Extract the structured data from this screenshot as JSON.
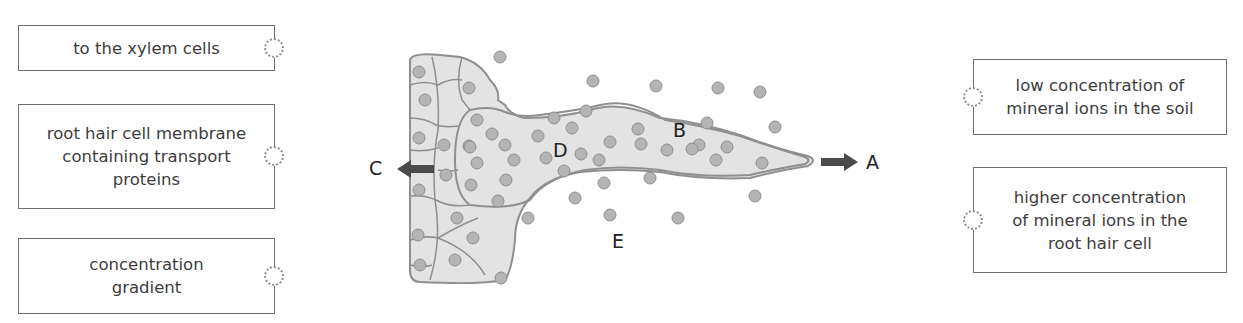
{
  "left_labels": [
    {
      "text": "to the xylem cells"
    },
    {
      "text": "root hair cell membrane containing transport proteins",
      "lines": [
        "root hair cell membrane",
        "containing transport",
        "proteins"
      ]
    },
    {
      "text": "concentration gradient",
      "lines": [
        "concentration",
        "gradient"
      ]
    }
  ],
  "right_labels": [
    {
      "text": "low concentration of mineral ions in the soil",
      "lines": [
        "low concentration of",
        "mineral ions in the soil"
      ]
    },
    {
      "text": "higher concentration of mineral ions in the root hair cell",
      "lines": [
        "higher concentration",
        "of mineral ions in the",
        "root hair cell"
      ]
    }
  ],
  "diagram": {
    "labels": {
      "A": "A",
      "B": "B",
      "C": "C",
      "D": "D",
      "E": "E"
    },
    "colors": {
      "cell_fill": "#e3e3e3",
      "cell_outline": "#8f8f8f",
      "ion_fill": "#b4b4b4",
      "arrow": "#4a4a4a"
    }
  }
}
